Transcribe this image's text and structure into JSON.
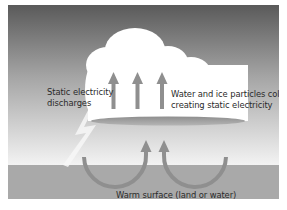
{
  "diagram": {
    "labels": {
      "discharge": [
        "Static electricity",
        "discharges"
      ],
      "collide": [
        "Water and ice particles collide",
        "creating static electricity"
      ],
      "surface": "Warm surface (land or water)"
    },
    "colors": {
      "sky_top": "#5c5c5c",
      "sky_bottom": "#f2f2f2",
      "ground": "#a9a9a9",
      "cloud": "#ffffff",
      "arrow": "#8f8f8f",
      "cloud_base": "#9a9a9a"
    },
    "elements": {
      "updraft_arrows": 3,
      "convection_loops": 2
    }
  }
}
